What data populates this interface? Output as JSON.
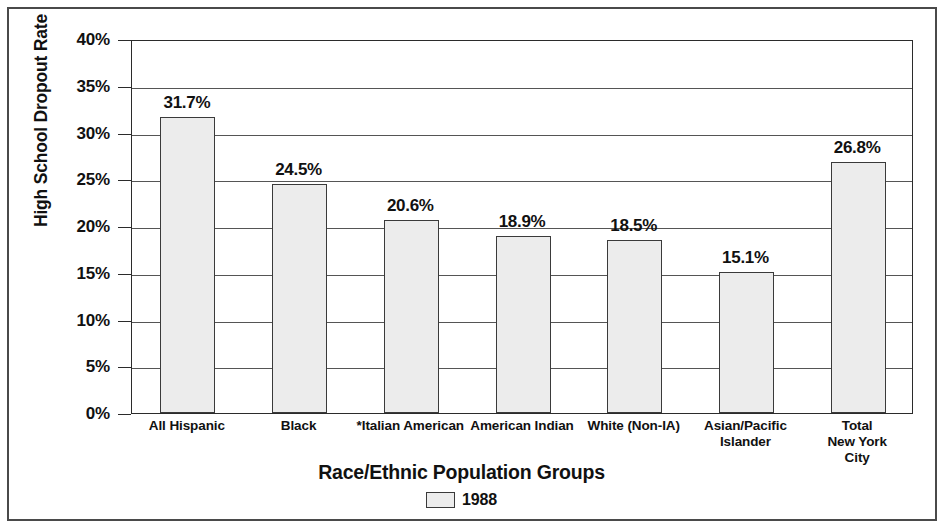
{
  "chart_data": {
    "type": "bar",
    "title": "",
    "xlabel": "Race/Ethnic Population Groups",
    "ylabel": "High School Dropout Rate",
    "categories": [
      "All Hispanic",
      "Black",
      "*Italian American",
      "American Indian",
      "White (Non-IA)",
      "Asian/Pacific\nIslander",
      "Total\nNew York City"
    ],
    "values": [
      31.7,
      24.5,
      20.6,
      18.9,
      18.5,
      15.1,
      26.8
    ],
    "value_labels": [
      "31.7%",
      "24.5%",
      "20.6%",
      "18.9%",
      "18.5%",
      "15.1%",
      "26.8%"
    ],
    "series": [
      {
        "name": "1988",
        "values": [
          31.7,
          24.5,
          20.6,
          18.9,
          18.5,
          15.1,
          26.8
        ]
      }
    ],
    "ylim": [
      0,
      40
    ],
    "ytick_values": [
      0,
      5,
      10,
      15,
      20,
      25,
      30,
      35,
      40
    ],
    "ytick_labels": [
      "0%",
      "5%",
      "10%",
      "15%",
      "20%",
      "25%",
      "30%",
      "35%",
      "40%"
    ],
    "grid": true,
    "legend_position": "bottom",
    "legend_entries": [
      "1988"
    ],
    "bar_fill_color": "#ececec",
    "bar_edge_color": "#3a3a3a",
    "axis_color": "#2b2b2b"
  },
  "legend": {
    "label": "1988"
  }
}
